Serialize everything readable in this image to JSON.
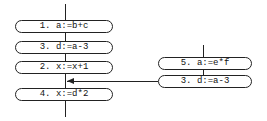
{
  "left_column": {
    "nodes": [
      {
        "label": "1. a:=b+c"
      },
      {
        "label": "3. d:=a-3"
      },
      {
        "label": "2. x:=x+1"
      },
      {
        "label": "4. x:=d*2"
      }
    ]
  },
  "right_column": {
    "nodes": [
      {
        "label": "5. a:=e*f"
      },
      {
        "label": "3. d:=a-3"
      }
    ]
  },
  "edges": [
    {
      "from": "right_column.nodes.1",
      "to": "left_column (between node 2 and node 4)",
      "type": "arrow"
    }
  ]
}
